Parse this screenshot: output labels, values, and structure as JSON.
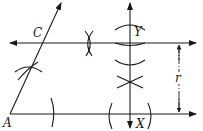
{
  "diagram": {
    "labels": {
      "A": "A",
      "C": "C",
      "Y": "Y",
      "X": "X",
      "r": "r"
    },
    "colors": {
      "stroke": "#1a1a1a",
      "background": "#ffffff"
    }
  }
}
